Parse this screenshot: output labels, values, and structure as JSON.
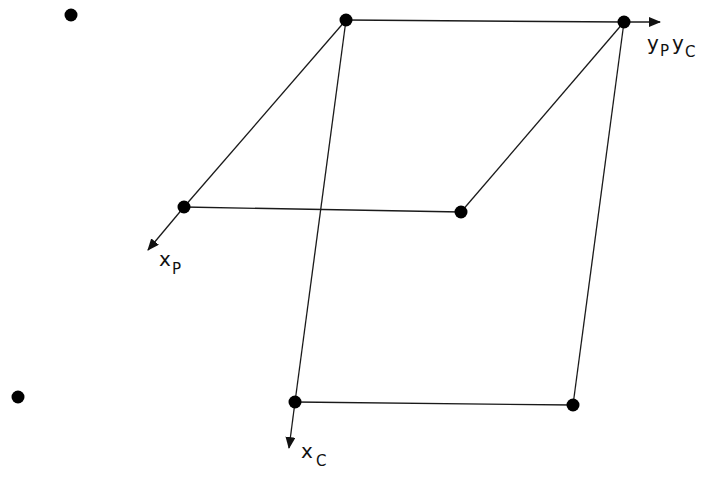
{
  "diagram": {
    "stroke_color": "#1a1a1a",
    "dot_color": "#000000",
    "labels": {
      "y_axis": {
        "main": "y",
        "sub1": "P",
        "main2": "y",
        "sub2": "C"
      },
      "x_parent": {
        "main": "x",
        "sub": "P"
      },
      "x_child": {
        "main": "x",
        "sub": "C"
      }
    },
    "points": {
      "top_left": [
        346,
        20
      ],
      "top_right": [
        624,
        22
      ],
      "parent_bottom_left": [
        184,
        207
      ],
      "parent_bottom_right": [
        461,
        212
      ],
      "child_bottom_left": [
        295,
        402
      ],
      "child_bottom_right": [
        573,
        405
      ],
      "stray_1": [
        71,
        15
      ],
      "stray_2": [
        18,
        397
      ]
    }
  }
}
